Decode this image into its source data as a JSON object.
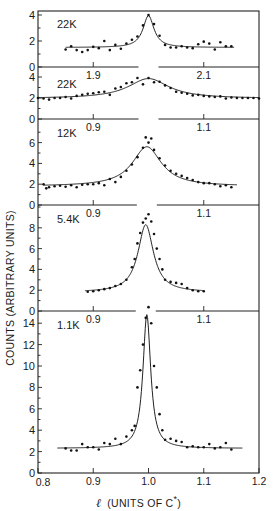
{
  "chart_data": {
    "type": "scatter",
    "title": "",
    "ylabel": "COUNTS (ARBITRARY UNITS)",
    "xlabel": {
      "symbol": "ℓ",
      "text": "(UNITS OF C",
      "sup": "*",
      "close": ")"
    },
    "x_ticks_bottom": [
      0.8,
      0.9,
      1.0,
      1.1,
      1.2
    ],
    "xlim": [
      0.8,
      1.2
    ],
    "grid": false,
    "legend": null,
    "panels": [
      {
        "label": "22K",
        "xlim": [
          1.8,
          2.2
        ],
        "x_tick_labels": [
          "1.9",
          "2.1"
        ],
        "x_ticks": [
          1.9,
          2.1
        ],
        "yticks": [
          0,
          2,
          4
        ],
        "ymax": 5,
        "points": [
          [
            1.85,
            1.35
          ],
          [
            1.86,
            1.6
          ],
          [
            1.87,
            1.3
          ],
          [
            1.88,
            1.15
          ],
          [
            1.89,
            1.3
          ],
          [
            1.9,
            1.55
          ],
          [
            1.91,
            1.45
          ],
          [
            1.92,
            2.0
          ],
          [
            1.93,
            1.3
          ],
          [
            1.94,
            1.7
          ],
          [
            1.95,
            1.4
          ],
          [
            1.96,
            1.8
          ],
          [
            1.97,
            2.1
          ],
          [
            1.98,
            2.35
          ],
          [
            1.99,
            3.2
          ],
          [
            2.0,
            4.0
          ],
          [
            2.01,
            3.3
          ],
          [
            2.02,
            2.4
          ],
          [
            2.03,
            1.7
          ],
          [
            2.04,
            1.5
          ],
          [
            2.05,
            1.5
          ],
          [
            2.06,
            1.6
          ],
          [
            2.07,
            1.5
          ],
          [
            2.08,
            1.45
          ],
          [
            2.09,
            1.75
          ],
          [
            2.1,
            1.95
          ],
          [
            2.11,
            1.8
          ],
          [
            2.12,
            1.35
          ],
          [
            2.13,
            1.9
          ],
          [
            2.14,
            1.6
          ],
          [
            2.15,
            1.6
          ]
        ],
        "fit": {
          "center": 2.0,
          "width": 0.012,
          "peak": 2.45,
          "background": 1.5,
          "range": [
            1.85,
            2.155
          ]
        }
      },
      {
        "label": "22K",
        "xlim": [
          0.8,
          1.2
        ],
        "x_tick_labels": [
          "0.9",
          "1.1"
        ],
        "x_ticks": [
          0.9,
          1.1
        ],
        "yticks": [
          0,
          2,
          4
        ],
        "ymax": 5,
        "points": [
          [
            0.8,
            2.0
          ],
          [
            0.81,
            1.95
          ],
          [
            0.82,
            1.85
          ],
          [
            0.83,
            2.0
          ],
          [
            0.84,
            2.0
          ],
          [
            0.85,
            2.1
          ],
          [
            0.86,
            1.95
          ],
          [
            0.87,
            2.2
          ],
          [
            0.88,
            2.3
          ],
          [
            0.89,
            2.4
          ],
          [
            0.9,
            2.45
          ],
          [
            0.91,
            2.55
          ],
          [
            0.92,
            2.6
          ],
          [
            0.93,
            2.3
          ],
          [
            0.94,
            2.9
          ],
          [
            0.95,
            3.05
          ],
          [
            0.96,
            3.4
          ],
          [
            0.97,
            3.5
          ],
          [
            0.98,
            3.9
          ],
          [
            0.99,
            3.3
          ],
          [
            1.0,
            3.9
          ],
          [
            1.01,
            3.5
          ],
          [
            1.02,
            3.55
          ],
          [
            1.03,
            3.2
          ],
          [
            1.04,
            2.95
          ],
          [
            1.05,
            2.6
          ],
          [
            1.06,
            2.5
          ],
          [
            1.07,
            2.4
          ],
          [
            1.08,
            2.25
          ],
          [
            1.09,
            2.3
          ],
          [
            1.1,
            2.2
          ],
          [
            1.11,
            2.15
          ],
          [
            1.12,
            2.1
          ],
          [
            1.13,
            2.15
          ],
          [
            1.14,
            1.95
          ],
          [
            1.15,
            2.05
          ],
          [
            1.16,
            2.0
          ],
          [
            1.17,
            2.0
          ],
          [
            1.18,
            2.0
          ],
          [
            1.19,
            2.0
          ],
          [
            1.2,
            1.95
          ]
        ],
        "fit": {
          "center": 1.0,
          "width": 0.045,
          "peak": 1.9,
          "background": 1.95,
          "range": [
            0.8,
            1.2
          ]
        }
      },
      {
        "label": "12K",
        "xlim": [
          0.8,
          1.2
        ],
        "x_tick_labels": [
          "0.9",
          "1.1"
        ],
        "x_ticks": [
          0.9,
          1.1
        ],
        "yticks": [
          0,
          2,
          4,
          6
        ],
        "ymax": 7,
        "points": [
          [
            0.81,
            2.0
          ],
          [
            0.815,
            1.6
          ],
          [
            0.82,
            1.7
          ],
          [
            0.83,
            1.8
          ],
          [
            0.84,
            1.85
          ],
          [
            0.85,
            1.75
          ],
          [
            0.86,
            1.9
          ],
          [
            0.87,
            1.7
          ],
          [
            0.88,
            1.95
          ],
          [
            0.89,
            2.0
          ],
          [
            0.9,
            2.0
          ],
          [
            0.91,
            2.1
          ],
          [
            0.92,
            1.9
          ],
          [
            0.93,
            2.5
          ],
          [
            0.94,
            2.2
          ],
          [
            0.95,
            2.7
          ],
          [
            0.96,
            3.3
          ],
          [
            0.97,
            3.9
          ],
          [
            0.98,
            4.6
          ],
          [
            0.99,
            5.5
          ],
          [
            0.995,
            6.5
          ],
          [
            1.0,
            6.0
          ],
          [
            1.005,
            6.4
          ],
          [
            1.01,
            5.3
          ],
          [
            1.02,
            4.5
          ],
          [
            1.03,
            3.8
          ],
          [
            1.04,
            3.3
          ],
          [
            1.05,
            3.0
          ],
          [
            1.06,
            2.8
          ],
          [
            1.07,
            2.6
          ],
          [
            1.08,
            2.4
          ],
          [
            1.09,
            2.2
          ],
          [
            1.1,
            2.1
          ],
          [
            1.11,
            2.1
          ],
          [
            1.12,
            2.0
          ],
          [
            1.13,
            1.8
          ],
          [
            1.14,
            1.9
          ],
          [
            1.15,
            1.7
          ]
        ],
        "fit": {
          "center": 0.997,
          "width": 0.032,
          "peak": 3.8,
          "background": 1.8,
          "range": [
            0.81,
            1.16
          ]
        }
      },
      {
        "label": "5.4K",
        "xlim": [
          0.8,
          1.2
        ],
        "x_tick_labels": [
          "0.9",
          "1.1"
        ],
        "x_ticks": [
          0.9,
          1.1
        ],
        "yticks": [
          0,
          2,
          4,
          6,
          8
        ],
        "ymax": 10,
        "points": [
          [
            0.89,
            1.85
          ],
          [
            0.9,
            1.9
          ],
          [
            0.91,
            2.0
          ],
          [
            0.92,
            2.1
          ],
          [
            0.93,
            2.2
          ],
          [
            0.94,
            2.4
          ],
          [
            0.95,
            2.6
          ],
          [
            0.96,
            3.0
          ],
          [
            0.97,
            4.2
          ],
          [
            0.975,
            5.0
          ],
          [
            0.98,
            6.5
          ],
          [
            0.985,
            7.5
          ],
          [
            0.99,
            8.5
          ],
          [
            0.995,
            8.9
          ],
          [
            1.0,
            9.3
          ],
          [
            1.005,
            8.6
          ],
          [
            1.01,
            7.4
          ],
          [
            1.015,
            6.0
          ],
          [
            1.02,
            5.0
          ],
          [
            1.025,
            4.0
          ],
          [
            1.03,
            3.0
          ],
          [
            1.04,
            2.8
          ],
          [
            1.05,
            2.7
          ],
          [
            1.06,
            2.6
          ],
          [
            1.07,
            2.2
          ],
          [
            1.08,
            2.0
          ],
          [
            1.09,
            1.9
          ],
          [
            1.1,
            1.9
          ]
        ],
        "fit": {
          "center": 0.995,
          "width": 0.017,
          "peak": 6.5,
          "background": 1.8,
          "range": [
            0.885,
            1.1
          ]
        }
      },
      {
        "label": "1.1K",
        "xlim": [
          0.8,
          1.2
        ],
        "x_tick_labels": [
          "0.8",
          "0.9",
          "1.0",
          "1.1",
          "1.2"
        ],
        "x_ticks": [
          0.8,
          0.9,
          1.0,
          1.1,
          1.2
        ],
        "yticks": [
          0,
          2,
          4,
          6,
          8,
          10,
          12,
          14
        ],
        "ymax": 15,
        "points": [
          [
            0.85,
            2.3
          ],
          [
            0.86,
            2.1
          ],
          [
            0.87,
            2.1
          ],
          [
            0.88,
            2.7
          ],
          [
            0.89,
            2.4
          ],
          [
            0.9,
            2.4
          ],
          [
            0.91,
            2.2
          ],
          [
            0.92,
            2.8
          ],
          [
            0.93,
            2.7
          ],
          [
            0.94,
            3.2
          ],
          [
            0.95,
            2.7
          ],
          [
            0.96,
            3.4
          ],
          [
            0.97,
            4.0
          ],
          [
            0.975,
            4.4
          ],
          [
            0.98,
            8.0
          ],
          [
            0.985,
            9.6
          ],
          [
            0.99,
            12.0
          ],
          [
            0.995,
            14.5
          ],
          [
            1.0,
            15.5
          ],
          [
            1.005,
            14.0
          ],
          [
            1.01,
            10.0
          ],
          [
            1.015,
            8.0
          ],
          [
            1.02,
            5.5
          ],
          [
            1.025,
            4.0
          ],
          [
            1.03,
            3.1
          ],
          [
            1.04,
            3.2
          ],
          [
            1.05,
            3.0
          ],
          [
            1.06,
            2.9
          ],
          [
            1.07,
            2.4
          ],
          [
            1.08,
            2.5
          ],
          [
            1.09,
            2.4
          ],
          [
            1.1,
            2.4
          ],
          [
            1.11,
            2.7
          ],
          [
            1.12,
            2.3
          ],
          [
            1.13,
            2.4
          ],
          [
            1.14,
            2.8
          ],
          [
            1.15,
            2.2
          ]
        ],
        "fit": {
          "center": 0.997,
          "width": 0.0085,
          "peak": 12.5,
          "background": 2.3,
          "range": [
            0.835,
            1.17
          ]
        }
      }
    ]
  },
  "labels": {
    "ylabel": "COUNTS (ARBITRARY UNITS)",
    "xlabel_symbol": "ℓ",
    "xlabel_text": "(UNITS OF C",
    "xlabel_sup": "*",
    "xlabel_close": ")"
  }
}
